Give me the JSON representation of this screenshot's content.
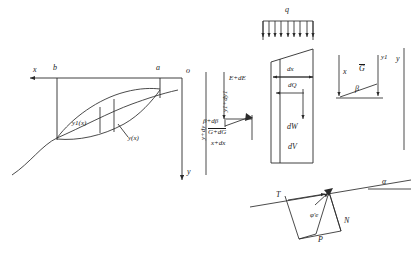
{
  "figure": {
    "stroke_color": "#2b2b2b",
    "background": "#ffffff"
  },
  "left_diagram": {
    "name": "admissible-curves-lens",
    "axis_x_label": "x",
    "axis_y_label": "y",
    "origin_label": "o",
    "endpoint_left_label": "b",
    "endpoint_right_label": "a",
    "curve_varied_label": "y1(x)",
    "curve_base_label": "y(x)",
    "vertical_offset_label": "y+dy"
  },
  "center_diagram": {
    "name": "slice-element",
    "load_label": "q",
    "width_label": "dx",
    "shear_label": "dQ",
    "weight_label": "dW",
    "volume_label": "dV",
    "energy_label": "E+dE",
    "angle_label": "β+dβ",
    "force_label": "G+dG",
    "station_label": "x+dx",
    "ordinate_label": "y1+dy1"
  },
  "right_diagram": {
    "name": "depth-ordinate-detail",
    "depth_label": "x",
    "force_label": "G",
    "angle_label": "β",
    "ordinate_label": "y1",
    "axis_label": "y"
  },
  "bottom_right_diagram": {
    "name": "slope-force-polygon",
    "slope_angle_label": "α",
    "tangential_label": "T",
    "normal_label": "N",
    "resultant_label": "P",
    "friction_angle_label": "φ'e"
  }
}
